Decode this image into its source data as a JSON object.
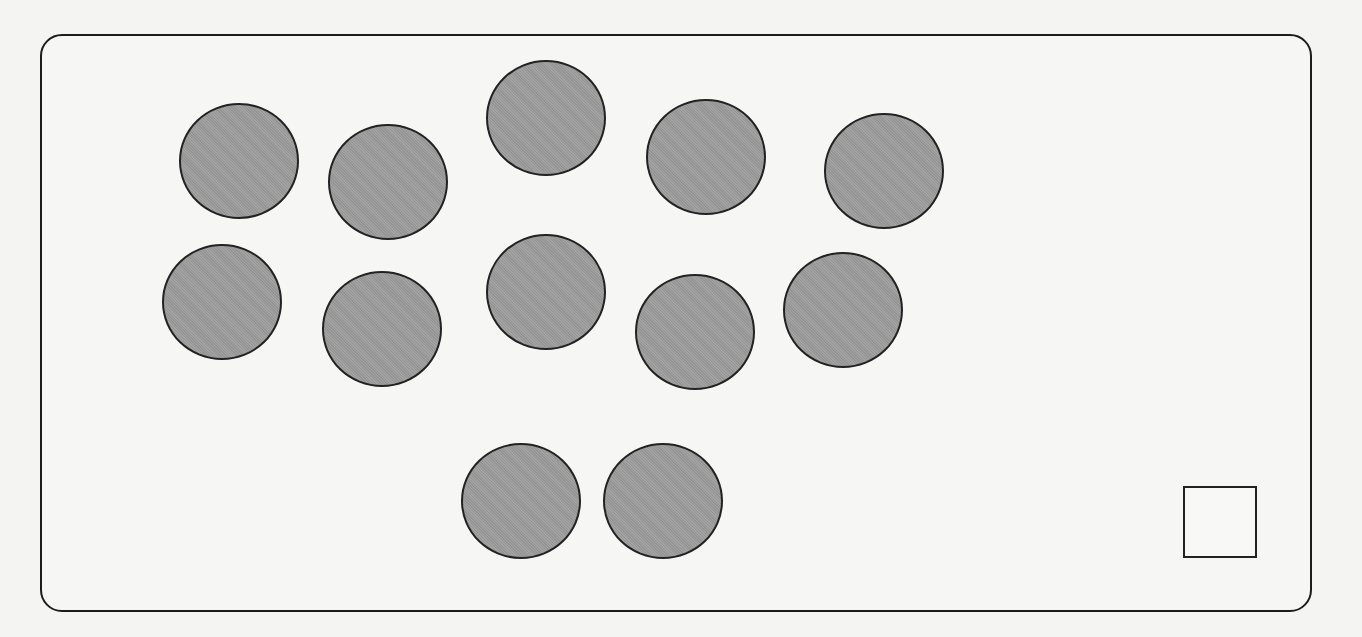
{
  "figure": {
    "circle_count": 12,
    "answer_box_value": "",
    "colors": {
      "circle_fill": "#9d9d9d",
      "outline": "#222222",
      "background": "#f6f6f4"
    },
    "circles": [
      {
        "id": 1,
        "cx": 239,
        "cy": 161
      },
      {
        "id": 2,
        "cx": 388,
        "cy": 182
      },
      {
        "id": 3,
        "cx": 546,
        "cy": 118
      },
      {
        "id": 4,
        "cx": 706,
        "cy": 157
      },
      {
        "id": 5,
        "cx": 884,
        "cy": 171
      },
      {
        "id": 6,
        "cx": 222,
        "cy": 302
      },
      {
        "id": 7,
        "cx": 382,
        "cy": 329
      },
      {
        "id": 8,
        "cx": 546,
        "cy": 292
      },
      {
        "id": 9,
        "cx": 695,
        "cy": 332
      },
      {
        "id": 10,
        "cx": 843,
        "cy": 310
      },
      {
        "id": 11,
        "cx": 521,
        "cy": 501
      },
      {
        "id": 12,
        "cx": 663,
        "cy": 501
      }
    ]
  }
}
